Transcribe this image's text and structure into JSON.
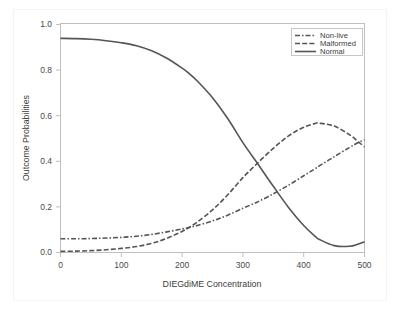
{
  "chart_data": {
    "type": "line",
    "title": "",
    "xlabel": "DIEGdiME Concentration",
    "ylabel": "Outcome Probabilities",
    "xlim": [
      0,
      500
    ],
    "ylim": [
      0.0,
      1.0
    ],
    "xticks": [
      0,
      100,
      200,
      300,
      400,
      500
    ],
    "xtick_labels": [
      "0",
      "100",
      "200",
      "300",
      "400",
      "500"
    ],
    "yticks": [
      0.0,
      0.2,
      0.4,
      0.6,
      0.8,
      1.0
    ],
    "ytick_labels": [
      "0.0",
      "0.2",
      "0.4",
      "0.6",
      "0.8",
      "1.0"
    ],
    "grid": false,
    "legend_position": "top-right-inside",
    "line_color": "#555555",
    "x": [
      0,
      25,
      50,
      75,
      100,
      125,
      150,
      175,
      200,
      210,
      225,
      250,
      275,
      300,
      320,
      325,
      350,
      375,
      400,
      420,
      425,
      450,
      475,
      490,
      500
    ],
    "series": [
      {
        "name": "Non-live",
        "style": "dashdot",
        "values": [
          0.06,
          0.06,
          0.061,
          0.063,
          0.066,
          0.071,
          0.079,
          0.09,
          0.103,
          0.108,
          0.118,
          0.138,
          0.163,
          0.193,
          0.216,
          0.222,
          0.256,
          0.294,
          0.335,
          0.368,
          0.377,
          0.418,
          0.458,
          0.48,
          0.492
        ]
      },
      {
        "name": "Malformed",
        "style": "dashed",
        "values": [
          0.005,
          0.006,
          0.008,
          0.012,
          0.018,
          0.026,
          0.04,
          0.062,
          0.092,
          0.107,
          0.133,
          0.186,
          0.252,
          0.327,
          0.38,
          0.393,
          0.455,
          0.509,
          0.547,
          0.564,
          0.565,
          0.552,
          0.515,
          0.483,
          0.461
        ]
      },
      {
        "name": "Normal",
        "style": "solid",
        "values": [
          0.935,
          0.934,
          0.931,
          0.925,
          0.916,
          0.903,
          0.881,
          0.848,
          0.805,
          0.785,
          0.749,
          0.676,
          0.585,
          0.48,
          0.404,
          0.385,
          0.289,
          0.197,
          0.118,
          0.068,
          0.058,
          0.03,
          0.027,
          0.037,
          0.047
        ]
      }
    ],
    "legend_entries": [
      "Non-live",
      "Malformed",
      "Normal"
    ],
    "annotations": []
  },
  "axes": {
    "x_title": "DIEGdiME Concentration",
    "y_title": "Outcome Probabilities"
  }
}
